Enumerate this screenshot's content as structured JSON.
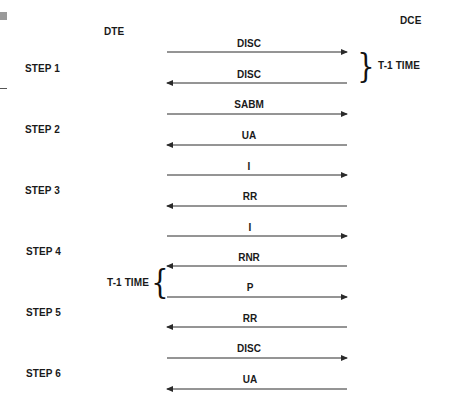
{
  "header": {
    "left_party": "DTE",
    "right_party": "DCE"
  },
  "steps": [
    {
      "label": "STEP 1",
      "y": 68
    },
    {
      "label": "STEP 2",
      "y": 129
    },
    {
      "label": "STEP 3",
      "y": 190
    },
    {
      "label": "STEP 4",
      "y": 250
    },
    {
      "label": "STEP 5",
      "y": 312
    },
    {
      "label": "STEP 6",
      "y": 373
    }
  ],
  "messages": [
    {
      "label": "DISC",
      "direction": "right",
      "y": 52
    },
    {
      "label": "DISC",
      "direction": "left",
      "y": 83
    },
    {
      "label": "SABM",
      "direction": "right",
      "y": 114
    },
    {
      "label": "UA",
      "direction": "left",
      "y": 145
    },
    {
      "label": "I",
      "direction": "right",
      "y": 175
    },
    {
      "label": "RR",
      "direction": "left",
      "y": 206
    },
    {
      "label": "I",
      "direction": "right",
      "y": 236
    },
    {
      "label": "RNR",
      "direction": "left",
      "y": 266
    },
    {
      "label": "P",
      "direction": "right",
      "y": 297
    },
    {
      "label": "RR",
      "direction": "left",
      "y": 327
    },
    {
      "label": "DISC",
      "direction": "right",
      "y": 358
    },
    {
      "label": "UA",
      "direction": "left",
      "y": 389
    }
  ],
  "annotations": {
    "timer_right": "T-1 TIME",
    "timer_left": "T-1 TIME"
  },
  "colors": {
    "line": "#2a2a2a",
    "text": "#1a1a1a",
    "corner_box": "#9a9a9a"
  }
}
